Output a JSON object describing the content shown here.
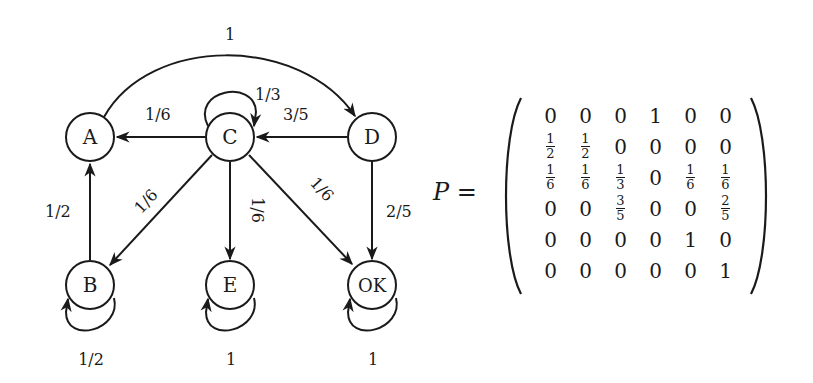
{
  "diagram": {
    "nodes": [
      {
        "id": "A",
        "label": "A",
        "cx": 90,
        "cy": 137
      },
      {
        "id": "C",
        "label": "C",
        "cx": 230,
        "cy": 137
      },
      {
        "id": "D",
        "label": "D",
        "cx": 372,
        "cy": 137
      },
      {
        "id": "B",
        "label": "B",
        "cx": 90,
        "cy": 285
      },
      {
        "id": "E",
        "label": "E",
        "cx": 230,
        "cy": 285
      },
      {
        "id": "OK",
        "label": "OK",
        "cx": 372,
        "cy": 285
      }
    ],
    "edges": [
      {
        "from": "A",
        "to": "D",
        "label": "1"
      },
      {
        "from": "C",
        "to": "C",
        "label": "1/3"
      },
      {
        "from": "C",
        "to": "A",
        "label": "1/6"
      },
      {
        "from": "D",
        "to": "C",
        "label": "3/5"
      },
      {
        "from": "B",
        "to": "A",
        "label": "1/2"
      },
      {
        "from": "C",
        "to": "B",
        "label": "1/6"
      },
      {
        "from": "C",
        "to": "E",
        "label": "1/6"
      },
      {
        "from": "C",
        "to": "OK",
        "label": "1/6"
      },
      {
        "from": "D",
        "to": "OK",
        "label": "2/5"
      },
      {
        "from": "B",
        "to": "B",
        "label": "1/2"
      },
      {
        "from": "E",
        "to": "E",
        "label": "1"
      },
      {
        "from": "OK",
        "to": "OK",
        "label": "1"
      }
    ]
  },
  "matrix": {
    "name": "P",
    "equals": "=",
    "rows": [
      [
        "0",
        "0",
        "0",
        "1",
        "0",
        "0"
      ],
      [
        "1/2",
        "1/2",
        "0",
        "0",
        "0",
        "0"
      ],
      [
        "1/6",
        "1/6",
        "1/3",
        "0",
        "1/6",
        "1/6"
      ],
      [
        "0",
        "0",
        "3/5",
        "0",
        "0",
        "2/5"
      ],
      [
        "0",
        "0",
        "0",
        "0",
        "1",
        "0"
      ],
      [
        "0",
        "0",
        "0",
        "0",
        "0",
        "1"
      ]
    ]
  }
}
